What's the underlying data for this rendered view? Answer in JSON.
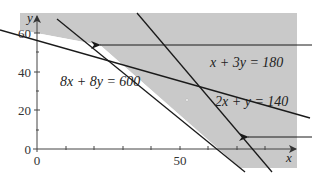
{
  "figure": {
    "type": "linear-programming-feasible-region",
    "colors": {
      "shade": "#c9c9c9",
      "background": "#ffffff",
      "line": "#1a1a1a",
      "axis": "#444444"
    },
    "axes": {
      "x_label": "x",
      "y_label": "y",
      "x_ticks": [
        {
          "value": 0,
          "label": "0"
        },
        {
          "value": 50,
          "label": "50"
        }
      ],
      "y_ticks": [
        {
          "value": 0,
          "label": "0"
        },
        {
          "value": 20,
          "label": "20"
        },
        {
          "value": 40,
          "label": "40"
        },
        {
          "value": 60,
          "label": "60"
        }
      ]
    },
    "constraints": [
      {
        "id": "c1",
        "label": "x + 3y = 180"
      },
      {
        "id": "c2",
        "label": "8x + 8y = 600"
      },
      {
        "id": "c3",
        "label": "2x + y = 140"
      }
    ],
    "arrows": [
      {
        "id": "arrow-upper",
        "direction": "left"
      },
      {
        "id": "arrow-lower",
        "direction": "left"
      }
    ]
  }
}
